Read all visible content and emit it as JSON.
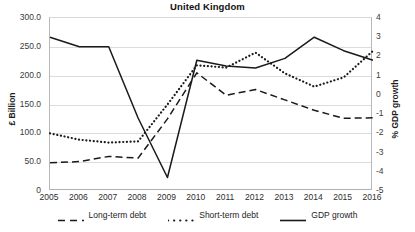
{
  "chart_data": {
    "type": "line",
    "title": "United Kingdom",
    "xlabel": "",
    "ylabel": "£ Billion",
    "ylabel_secondary": "% GDP growth",
    "x": [
      2005,
      2006,
      2007,
      2008,
      2009,
      2010,
      2011,
      2012,
      2013,
      2014,
      2015,
      2016
    ],
    "xticklabels": [
      "2005",
      "2006",
      "2007",
      "2008",
      "2009",
      "2010",
      "2011",
      "2012",
      "2013",
      "2014",
      "2015",
      "2016"
    ],
    "ylim": [
      0,
      300
    ],
    "yticklabels": [
      "300.0",
      "250.0",
      "200.0",
      "150.0",
      "100.0",
      "50.0",
      "0"
    ],
    "ytickvalues": [
      300,
      250,
      200,
      150,
      100,
      50,
      0
    ],
    "ylim_secondary": [
      -5,
      4
    ],
    "yticklabels_secondary": [
      "4",
      "3",
      "2",
      "1",
      "0",
      "-1",
      "-2",
      "-3",
      "-4",
      "-5"
    ],
    "ytickvalues_secondary": [
      4,
      3,
      2,
      1,
      0,
      -1,
      -2,
      -3,
      -4,
      -5
    ],
    "grid": true,
    "legend_position": "bottom",
    "series": [
      {
        "name": "Long-term debt",
        "axis": "left",
        "style": "dashed",
        "color": "#1a1a1a",
        "values": [
          49,
          51,
          60,
          57,
          125,
          205,
          166,
          176,
          158,
          140,
          126,
          127
        ]
      },
      {
        "name": "Short-term debt",
        "axis": "left",
        "style": "dotted",
        "color": "#1a1a1a",
        "values": [
          100,
          89,
          84,
          86,
          150,
          218,
          214,
          240,
          204,
          181,
          197,
          243
        ]
      },
      {
        "name": "GDP growth",
        "axis": "right",
        "style": "solid",
        "color": "#1a1a1a",
        "values": [
          3.0,
          2.5,
          2.5,
          -1.2,
          -4.3,
          1.8,
          1.5,
          1.4,
          1.9,
          3.0,
          2.3,
          1.8
        ]
      }
    ]
  }
}
